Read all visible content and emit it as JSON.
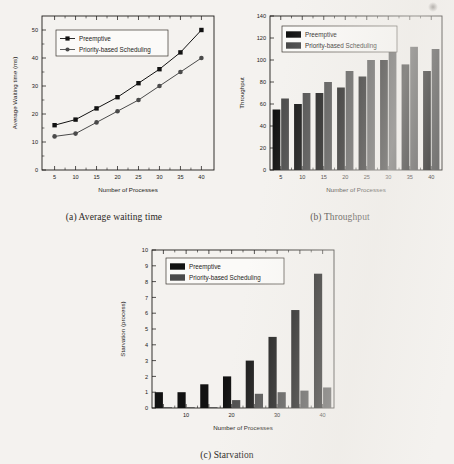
{
  "figure_page": {
    "background_color": "#f4f2ef",
    "series_colors": {
      "preemptive": "#121212",
      "priority": "#4a4a4a"
    }
  },
  "legend": {
    "preemptive": "Preemptive",
    "priority": "Priority-based Scheduling"
  },
  "captions": {
    "a": "(a) Average waiting time",
    "b": "(b) Throughput",
    "c": "(c) Starvation"
  },
  "chart_data": [
    {
      "id": "a",
      "type": "line",
      "title": "",
      "caption": "(a) Average waiting time",
      "xlabel": "Number of Processes",
      "ylabel": "Average Waiting time (ms)",
      "x": [
        5,
        10,
        15,
        20,
        25,
        30,
        35,
        40
      ],
      "xticks": [
        5,
        10,
        15,
        20,
        25,
        30,
        35,
        40
      ],
      "yticks": [
        0,
        10,
        20,
        30,
        40,
        50
      ],
      "xlim": [
        2,
        43
      ],
      "ylim": [
        0,
        55
      ],
      "grid": false,
      "legend_position": "top-left",
      "series": [
        {
          "name": "Preemptive",
          "marker": "square",
          "color": "#121212",
          "values": [
            16,
            18,
            22,
            26,
            31,
            36,
            42,
            50
          ]
        },
        {
          "name": "Priority-based Scheduling",
          "marker": "circle",
          "color": "#4a4a4a",
          "values": [
            12,
            13,
            17,
            21,
            25,
            30,
            35,
            40
          ]
        }
      ]
    },
    {
      "id": "b",
      "type": "bar",
      "title": "",
      "caption": "(b) Throughput",
      "xlabel": "Number of Processes",
      "ylabel": "Throughput",
      "categories": [
        "5",
        "10",
        "15",
        "20",
        "25",
        "30",
        "35",
        "40"
      ],
      "xticks": [
        5,
        10,
        15,
        20,
        25,
        30,
        35,
        40
      ],
      "yticks": [
        0,
        20,
        40,
        60,
        80,
        100,
        120,
        140
      ],
      "ylim": [
        0,
        140
      ],
      "grid": false,
      "legend_position": "top-left",
      "series": [
        {
          "name": "Preemptive",
          "color": "#121212",
          "values": [
            55,
            60,
            70,
            75,
            85,
            100,
            96,
            90
          ]
        },
        {
          "name": "Priority-based Scheduling",
          "color": "#4a4a4a",
          "values": [
            65,
            70,
            80,
            90,
            100,
            115,
            112,
            110
          ]
        }
      ]
    },
    {
      "id": "c",
      "type": "bar",
      "title": "",
      "caption": "(c) Starvation",
      "xlabel": "Number of Processes",
      "ylabel": "Starvation (process)",
      "categories": [
        "5",
        "10",
        "15",
        "20",
        "25",
        "30",
        "35",
        "40"
      ],
      "xticks": [
        10,
        20,
        30,
        40
      ],
      "yticks": [
        0,
        1,
        2,
        3,
        4,
        5,
        6,
        7,
        8,
        9,
        10
      ],
      "ylim": [
        0,
        10
      ],
      "grid": false,
      "legend_position": "top-left",
      "series": [
        {
          "name": "Preemptive",
          "color": "#121212",
          "values": [
            1.0,
            1.0,
            1.5,
            2.0,
            3.0,
            4.5,
            6.2,
            8.5
          ]
        },
        {
          "name": "Priority-based Scheduling",
          "color": "#4a4a4a",
          "values": [
            0.05,
            0.05,
            0.05,
            0.5,
            0.9,
            1.0,
            1.1,
            1.3
          ]
        }
      ]
    }
  ]
}
